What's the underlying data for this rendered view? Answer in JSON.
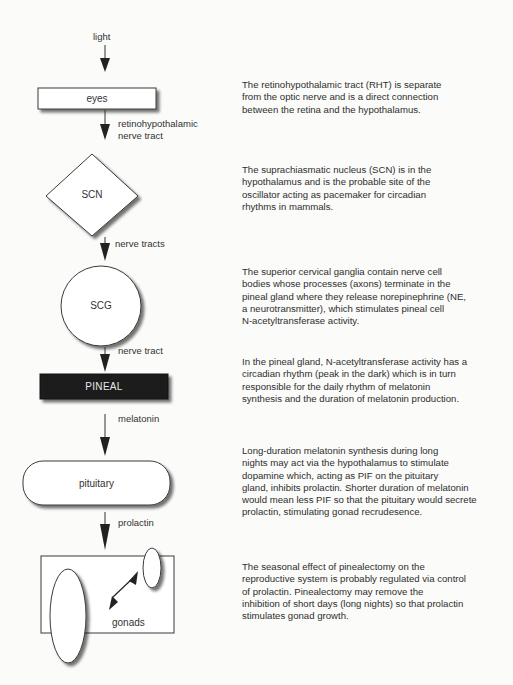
{
  "flowchart": {
    "input_label": "light",
    "nodes": [
      {
        "id": "eyes",
        "shape": "rectangle",
        "label": "eyes"
      },
      {
        "id": "scn",
        "shape": "diamond",
        "label": "SCN"
      },
      {
        "id": "scg",
        "shape": "circle",
        "label": "SCG"
      },
      {
        "id": "pineal",
        "shape": "filled-rectangle",
        "label": "PINEAL"
      },
      {
        "id": "pituitary",
        "shape": "rounded-rectangle",
        "label": "pituitary"
      },
      {
        "id": "gonads",
        "shape": "rectangle-with-ellipses",
        "label": "gonads"
      }
    ],
    "edges": [
      {
        "from": "light",
        "to": "eyes",
        "label_line1": "",
        "label_line2": ""
      },
      {
        "from": "eyes",
        "to": "scn",
        "label_line1": "retinohypothalamic",
        "label_line2": "nerve tract"
      },
      {
        "from": "scn",
        "to": "scg",
        "label_line1": "nerve tracts",
        "label_line2": ""
      },
      {
        "from": "scg",
        "to": "pineal",
        "label_line1": "nerve tract",
        "label_line2": ""
      },
      {
        "from": "pineal",
        "to": "pituitary",
        "label_line1": "melatonin",
        "label_line2": ""
      },
      {
        "from": "pituitary",
        "to": "gonads",
        "label_line1": "prolactin",
        "label_line2": ""
      }
    ]
  },
  "descriptions": [
    {
      "lines": [
        "The retinohypothalamic tract (RHT) is separate",
        "from the optic nerve and is a direct connection",
        "between the retina and the hypothalamus."
      ]
    },
    {
      "lines": [
        "The suprachiasmatic nucleus (SCN) is in the",
        "hypothalamus and is the probable site of the",
        "oscillator acting as pacemaker for circadian",
        "rhythms in mammals."
      ]
    },
    {
      "lines": [
        "The superior cervical ganglia contain nerve cell",
        "bodies whose processes (axons) terminate in the",
        "pineal gland where they release norepinephrine (NE,",
        "a neurotransmitter), which stimulates pineal cell",
        "N-acetyltransferase activity."
      ]
    },
    {
      "lines": [
        "In the pineal gland, N-acetyltransferase activity has a",
        "circadian rhythm (peak in the dark) which is in turn",
        "responsible for the daily rhythm of melatonin",
        "synthesis and the duration of melatonin production."
      ]
    },
    {
      "lines": [
        "Long-duration melatonin synthesis during long",
        "nights may act via the hypothalamus to stimulate",
        "dopamine which, acting as PIF on the pituitary",
        "gland, inhibits prolactin.  Shorter duration of melatonin",
        "would mean less PIF so that the pituitary would secrete",
        "prolactin, stimulating gonad recrudesence."
      ]
    },
    {
      "lines": [
        "The seasonal effect of pinealectomy on the",
        "reproductive system is probably regulated via control",
        "of prolactin.  Pinealectomy may remove the",
        "inhibition of short days (long nights) so that prolactin",
        "stimulates gonad growth."
      ]
    }
  ],
  "colors": {
    "background": "#fbfbf9",
    "stroke": "#3a3a3a",
    "pineal_fill": "#1c1c1c",
    "pineal_text": "#e8e8e8",
    "shadow": "#8a8a8a"
  }
}
